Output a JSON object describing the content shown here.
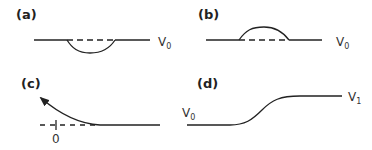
{
  "panels": {
    "a": {
      "label": "(a)",
      "level": "V",
      "level_sub": "0"
    },
    "b": {
      "label": "(b)",
      "level": "V",
      "level_sub": "0"
    },
    "c": {
      "label": "(c)",
      "origin": "0"
    },
    "d": {
      "label": "(d)",
      "start": "V",
      "start_sub": "0",
      "end": "V",
      "end_sub": "1"
    }
  },
  "colors": {
    "stroke": "#222222"
  }
}
